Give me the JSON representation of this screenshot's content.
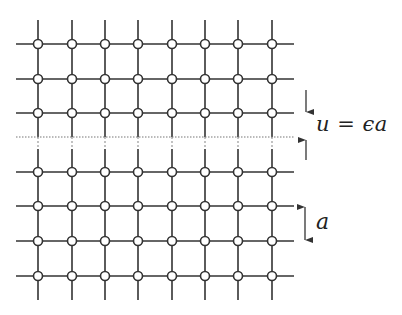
{
  "diagram": {
    "type": "square-lattice-with-strained-interface",
    "colors": {
      "line": "#333333",
      "node_fill": "#ffffff",
      "node_stroke": "#333333",
      "interface": "#666666",
      "arrow": "#333333"
    },
    "columns_x": [
      38,
      72,
      105,
      138,
      172,
      205,
      238,
      272
    ],
    "rows_y_upper": [
      44,
      79,
      113
    ],
    "rows_y_lower": [
      172,
      206,
      241,
      276
    ],
    "extent": {
      "left": 16,
      "right": 294,
      "top": 20,
      "bottom": 300
    },
    "interface_y": 137,
    "node_radius": 4.5,
    "labels": {
      "strain": "u = ϵa",
      "spacing": "a"
    },
    "arrows": {
      "strain_down": {
        "x": 306,
        "y1": 90,
        "y2": 112
      },
      "strain_up": {
        "x": 306,
        "y1": 160,
        "y2": 140
      },
      "spacing": {
        "x": 305,
        "y1": 207,
        "y2": 240
      }
    }
  }
}
